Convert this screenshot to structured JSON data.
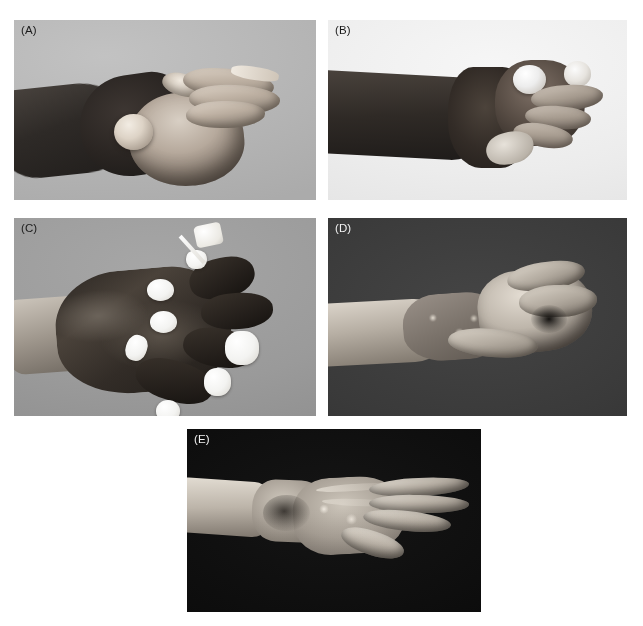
{
  "figure": {
    "background_color": "#ffffff",
    "layout": "2-2-1 grid of clinical photographs",
    "panel_count": 5,
    "panels": [
      {
        "id": "A",
        "label": "(A)",
        "label_color": "#1a1a1a",
        "background_color": "#b9b9b9",
        "tone": "light-grey studio background",
        "subject": "dorsal-lateral view of burned hand with dark eschar over dorsum, pale blistered palm and digits",
        "x": 14,
        "y": 20,
        "width": 302,
        "height": 180
      },
      {
        "id": "B",
        "label": "(B)",
        "label_color": "#1a1a1a",
        "background_color": "#efefef",
        "tone": "near-white studio background",
        "subject": "end-on view of forearm and burned hand with blistered knuckles and sloughing digits",
        "x": 328,
        "y": 20,
        "width": 299,
        "height": 180
      },
      {
        "id": "C",
        "label": "(C)",
        "label_color": "#1a1a1a",
        "background_color": "#9b9b9b",
        "tone": "mid-grey studio background",
        "subject": "dorsum of hand covered in black necrotic eschar with white dressing pledgets and cotton swab",
        "x": 14,
        "y": 218,
        "width": 302,
        "height": 198
      },
      {
        "id": "D",
        "label": "(D)",
        "label_color": "#f2f2f2",
        "background_color": "#3a3a3a",
        "tone": "dark grey background",
        "subject": "healed hand and forearm after grafting, flexed fingers, mottled graft on dorsum of wrist",
        "x": 328,
        "y": 218,
        "width": 299,
        "height": 198
      },
      {
        "id": "E",
        "label": "(E)",
        "label_color": "#f2f2f2",
        "background_color": "#0c0c0c",
        "tone": "black background",
        "subject": "final result, hand extended with healed grafted dorsum and preserved finger extension",
        "x": 187,
        "y": 429,
        "width": 294,
        "height": 183
      }
    ]
  }
}
